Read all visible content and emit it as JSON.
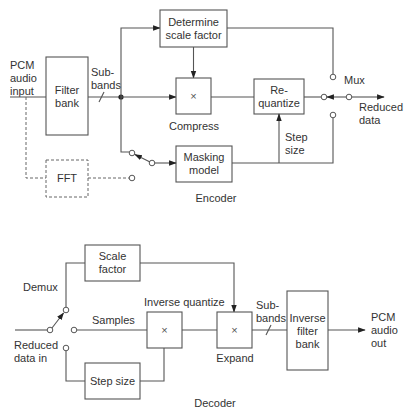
{
  "encoder": {
    "title": "Encoder",
    "input_label": [
      "PCM",
      "audio",
      "input"
    ],
    "filter_bank": [
      "Filter",
      "bank"
    ],
    "subbands_label": [
      "Sub-",
      "bands"
    ],
    "determine_scale": [
      "Determine",
      "scale factor"
    ],
    "compress_symbol": "×",
    "compress_label": "Compress",
    "requantize": [
      "Re-",
      "quantize"
    ],
    "masking_model": [
      "Masking",
      "model"
    ],
    "fft": "FFT",
    "step_size_label": [
      "Step",
      "size"
    ],
    "mux_label": "Mux",
    "output_label": [
      "Reduced",
      "data"
    ]
  },
  "decoder": {
    "title": "Decoder",
    "demux_label": "Demux",
    "input_label": [
      "Reduced",
      "data in"
    ],
    "scale_factor": [
      "Scale",
      "factor"
    ],
    "samples_label": "Samples",
    "step_size": "Step size",
    "inverse_quantize_label": "Inverse quantize",
    "inverse_quantize_symbol": "×",
    "expand_symbol": "×",
    "expand_label": "Expand",
    "subbands_label": [
      "Sub-",
      "bands"
    ],
    "inverse_filter_bank": [
      "Inverse",
      "filter",
      "bank"
    ],
    "output_label": [
      "PCM",
      "audio",
      "out"
    ]
  }
}
